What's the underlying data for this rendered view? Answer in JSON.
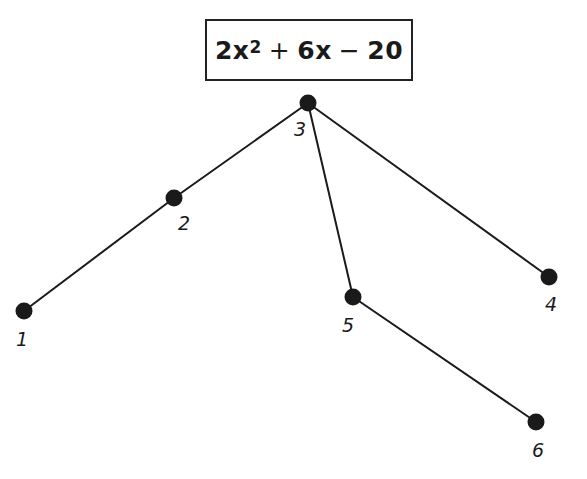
{
  "expression": {
    "coef_a": "2x",
    "exponent": "2",
    "op1": "+",
    "term2": "6x",
    "op2": "−",
    "term3": "20",
    "full_text": "2x^2 + 6x − 20"
  },
  "tree": {
    "root": "3",
    "nodes": [
      {
        "id": "1",
        "label": "1",
        "x": 24,
        "y": 311,
        "label_x": 22,
        "label_y": 328
      },
      {
        "id": "2",
        "label": "2",
        "x": 174,
        "y": 198,
        "label_x": 184,
        "label_y": 212
      },
      {
        "id": "3",
        "label": "3",
        "x": 308,
        "y": 103,
        "label_x": 300,
        "label_y": 118
      },
      {
        "id": "4",
        "label": "4",
        "x": 549,
        "y": 277,
        "label_x": 551,
        "label_y": 293
      },
      {
        "id": "5",
        "label": "5",
        "x": 353,
        "y": 297,
        "label_x": 348,
        "label_y": 314
      },
      {
        "id": "6",
        "label": "6",
        "x": 536,
        "y": 422,
        "label_x": 538,
        "label_y": 439
      }
    ],
    "edges": [
      {
        "from": "3",
        "to": "2"
      },
      {
        "from": "2",
        "to": "1"
      },
      {
        "from": "3",
        "to": "5"
      },
      {
        "from": "5",
        "to": "6"
      },
      {
        "from": "3",
        "to": "4"
      }
    ]
  },
  "colors": {
    "ink": "#1a1a1a",
    "background": "#ffffff"
  }
}
